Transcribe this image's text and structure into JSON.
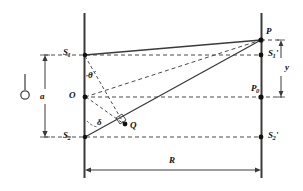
{
  "figure": {
    "type": "optics-geometry-diagram",
    "colors": {
      "line": "#3a3a3a",
      "dashed": "#4a4a4a",
      "point": "#111111",
      "background": "#ffffff",
      "label": "#111111"
    },
    "labels": {
      "source_point": {
        "name": "light-source-symbol",
        "text": ""
      },
      "s1": {
        "text": "S",
        "subscript": "1",
        "prime": ""
      },
      "s2": {
        "text": "S",
        "subscript": "2",
        "prime": ""
      },
      "s1_prime": {
        "text": "S",
        "subscript": "1",
        "prime": "'"
      },
      "s2_prime": {
        "text": "S",
        "subscript": "2",
        "prime": "'"
      },
      "o": {
        "text": "O",
        "subscript": "",
        "prime": ""
      },
      "q": {
        "text": "Q",
        "subscript": "",
        "prime": ""
      },
      "p": {
        "text": "P",
        "subscript": "",
        "prime": ""
      },
      "p0": {
        "text": "P",
        "subscript": "0",
        "prime": ""
      },
      "theta": {
        "text": "θ"
      },
      "delta": {
        "text": "δ"
      },
      "a": {
        "text": "a"
      },
      "y": {
        "text": "y"
      },
      "r": {
        "text": "R"
      }
    },
    "dimensions": {
      "slit_separation_label": "a",
      "screen_distance_label": "R",
      "height_on_screen_label": "y"
    },
    "angles": {
      "theta_label": "θ",
      "delta_label": "δ"
    }
  }
}
